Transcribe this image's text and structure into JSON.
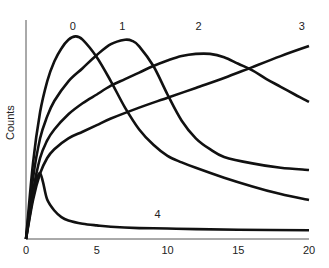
{
  "chart_data": {
    "type": "line",
    "title": "",
    "xlabel": "",
    "ylabel": "Counts",
    "xlim": [
      0,
      20
    ],
    "ylim": [
      0,
      100
    ],
    "x_ticks": [
      0,
      5,
      10,
      15,
      20
    ],
    "x_tick_labels": [
      "0",
      "5",
      "10",
      "15",
      "20"
    ],
    "y_ticks": [],
    "grid": false,
    "legend": "none (curves labeled inline)",
    "series": [
      {
        "name": "0",
        "label_pos": [
          3.3,
          97
        ],
        "x": [
          0,
          0.5,
          1,
          1.5,
          2,
          2.5,
          3,
          3.5,
          4,
          5,
          6,
          7,
          8,
          9,
          10,
          11,
          12,
          14,
          16,
          18,
          20
        ],
        "y": [
          0,
          35,
          58,
          72,
          81,
          87,
          91,
          92.5,
          91,
          83,
          72,
          60,
          50,
          43,
          38,
          35,
          32.5,
          28,
          24,
          20.5,
          17.8
        ]
      },
      {
        "name": "1",
        "label_pos": [
          6.8,
          97
        ],
        "x": [
          0,
          0.5,
          1,
          1.5,
          2,
          3,
          4,
          5,
          6,
          7,
          7.5,
          8,
          9,
          10,
          11,
          12,
          13,
          14,
          16,
          18,
          20
        ],
        "y": [
          0,
          28,
          46,
          56,
          63,
          72,
          78,
          84,
          89,
          91,
          90.5,
          88,
          79,
          66,
          54,
          46,
          41,
          37.5,
          34.5,
          32.5,
          31.5
        ]
      },
      {
        "name": "2",
        "label_pos": [
          12.2,
          97
        ],
        "x": [
          0,
          0.5,
          1,
          1.5,
          2,
          3,
          4,
          5,
          6,
          7,
          8,
          9,
          10,
          11,
          12,
          13,
          14,
          15,
          16,
          17,
          18,
          19,
          20
        ],
        "y": [
          0,
          22,
          37,
          45,
          50,
          57,
          62,
          66,
          70,
          73,
          76,
          79,
          81.5,
          83.5,
          84.5,
          84.5,
          83,
          80,
          77,
          73,
          69.5,
          66,
          62.6
        ]
      },
      {
        "name": "3",
        "label_pos": [
          19.5,
          97
        ],
        "x": [
          0,
          0.5,
          1,
          1.5,
          2,
          3,
          4,
          5,
          6,
          8,
          10,
          12,
          14,
          16,
          18,
          20
        ],
        "y": [
          0,
          18,
          30,
          37,
          41,
          46,
          49,
          52,
          55,
          60,
          64.5,
          69,
          73.5,
          78.5,
          83.5,
          88.1
        ]
      },
      {
        "name": "4",
        "label_pos": [
          9.3,
          11
        ],
        "x": [
          0,
          0.5,
          0.8,
          1.0,
          1.2,
          1.5,
          2,
          2.5,
          3,
          4,
          5,
          6,
          8,
          10,
          12,
          15,
          20
        ],
        "y": [
          0,
          20,
          28,
          30,
          26,
          18,
          13,
          10,
          8.5,
          7,
          6.2,
          5.6,
          5,
          4.8,
          4.5,
          4.2,
          4
        ]
      }
    ]
  }
}
